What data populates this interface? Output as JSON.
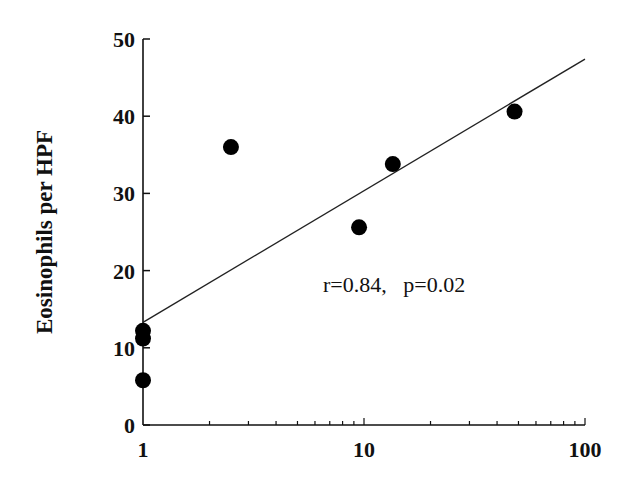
{
  "chart_data": {
    "type": "scatter",
    "title": "",
    "xlabel": "",
    "ylabel": "Eosinophils per HPF",
    "xscale": "log",
    "xlim": [
      1,
      100
    ],
    "ylim": [
      0,
      50
    ],
    "x_ticks": [
      "1",
      "10",
      "100"
    ],
    "y_ticks": [
      "0",
      "10",
      "20",
      "30",
      "40",
      "50"
    ],
    "grid": false,
    "legend": null,
    "points": [
      {
        "x": 1,
        "y": 12.2
      },
      {
        "x": 1,
        "y": 11.2
      },
      {
        "x": 1,
        "y": 5.8
      },
      {
        "x": 2.5,
        "y": 36.0
      },
      {
        "x": 9.5,
        "y": 25.6
      },
      {
        "x": 13.5,
        "y": 33.8
      },
      {
        "x": 48,
        "y": 40.6
      }
    ],
    "regression_line": {
      "x": [
        1,
        100
      ],
      "y": [
        13.3,
        47.4
      ]
    },
    "annotation": "r=0.84,   p=0.02"
  }
}
